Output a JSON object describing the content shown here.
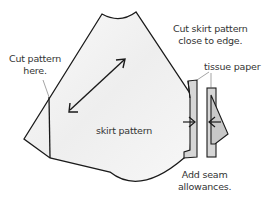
{
  "diagram": {
    "labels": {
      "cut_pattern": "Cut pattern\nhere.",
      "cut_pattern_line1": "Cut pattern",
      "cut_pattern_line2": "here.",
      "cut_skirt_line1": "Cut skirt pattern",
      "cut_skirt_line2": "close to edge.",
      "tissue_paper": "tissue paper",
      "skirt_pattern": "skirt pattern",
      "seam_line1": "Add seam",
      "seam_line2": "allowances."
    },
    "colors": {
      "stroke": "#1a1a1a",
      "fill_pattern": "#f4f4f4",
      "fill_tissue": "#d8d8d8",
      "text": "#333333"
    }
  }
}
